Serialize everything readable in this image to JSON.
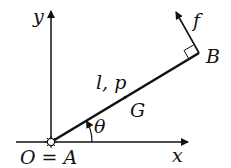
{
  "diagram": {
    "axes": {
      "x_label": "x",
      "y_label": "y",
      "origin_label": "O = A"
    },
    "rod": {
      "label": "l, p",
      "center_label": "G",
      "end_label": "B",
      "angle_label": "θ"
    },
    "force": {
      "label": "f"
    },
    "colors": {
      "ink": "#111111",
      "background": "#ffffff"
    }
  }
}
